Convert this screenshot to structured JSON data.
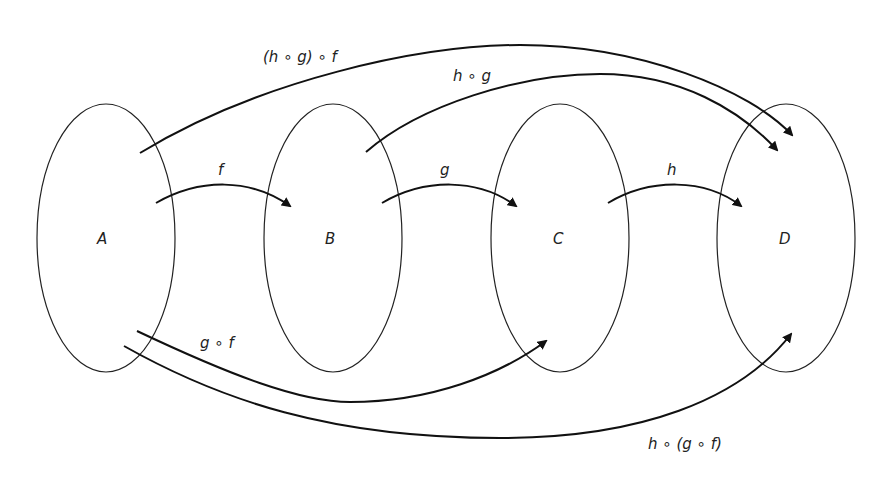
{
  "diagram": {
    "title": "",
    "stroke_color": "#111111",
    "sets": [
      {
        "id": "A",
        "label": "A"
      },
      {
        "id": "B",
        "label": "B"
      },
      {
        "id": "C",
        "label": "C"
      },
      {
        "id": "D",
        "label": "D"
      }
    ],
    "mappings": [
      {
        "id": "f",
        "label": "f",
        "from": "A",
        "to": "B"
      },
      {
        "id": "g",
        "label": "g",
        "from": "B",
        "to": "C"
      },
      {
        "id": "h",
        "label": "h",
        "from": "C",
        "to": "D"
      },
      {
        "id": "g_o_f",
        "label": "g ∘ f",
        "from": "A",
        "to": "C"
      },
      {
        "id": "h_o_g",
        "label": "h ∘ g",
        "from": "B",
        "to": "D"
      },
      {
        "id": "hg_o_f",
        "label": "(h ∘ g) ∘ f",
        "from": "A",
        "to": "D"
      },
      {
        "id": "h_o_gf",
        "label": "h ∘ (g ∘ f)",
        "from": "A",
        "to": "D"
      }
    ]
  }
}
